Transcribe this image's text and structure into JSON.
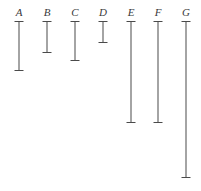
{
  "figure": {
    "width": 201,
    "height": 191,
    "background": "#ffffff",
    "line_color": "#4a4a4a",
    "label_color": "#3a3a3a"
  },
  "chart_data": {
    "type": "bar",
    "title": "",
    "xlabel": "",
    "ylabel": "",
    "orientation": "vertical-intervals",
    "grid": false,
    "legend": false,
    "categories": [
      "A",
      "B",
      "C",
      "D",
      "E",
      "F",
      "G"
    ],
    "top_y": 21,
    "bottom_y": [
      70,
      52,
      60,
      42,
      122,
      122,
      177
    ],
    "values": [
      49,
      31,
      39,
      21,
      101,
      101,
      156
    ],
    "x_positions": [
      19,
      47,
      75,
      103,
      131,
      158,
      186
    ],
    "cap_width": 9,
    "ylim": [
      21,
      191
    ]
  },
  "items": [
    {
      "label": "A",
      "x": 19,
      "top": 21,
      "bottom": 70,
      "label_y": 7
    },
    {
      "label": "B",
      "x": 47,
      "top": 21,
      "bottom": 52,
      "label_y": 7
    },
    {
      "label": "C",
      "x": 75,
      "top": 21,
      "bottom": 60,
      "label_y": 7
    },
    {
      "label": "D",
      "x": 103,
      "top": 21,
      "bottom": 42,
      "label_y": 7
    },
    {
      "label": "E",
      "x": 131,
      "top": 21,
      "bottom": 122,
      "label_y": 7
    },
    {
      "label": "F",
      "x": 158,
      "top": 21,
      "bottom": 122,
      "label_y": 7
    },
    {
      "label": "G",
      "x": 186,
      "top": 21,
      "bottom": 177,
      "label_y": 7
    }
  ]
}
